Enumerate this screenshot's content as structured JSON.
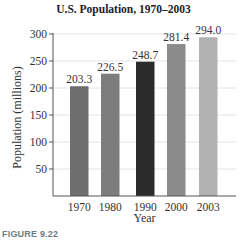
{
  "chart_data": {
    "type": "bar",
    "title": "U.S. Population, 1970–2003",
    "xlabel": "Year",
    "ylabel": "Population (millions)",
    "categories": [
      "1970",
      "1980",
      "1990",
      "2000",
      "2003"
    ],
    "values": [
      203.3,
      226.5,
      248.7,
      281.4,
      294.0
    ],
    "value_labels": [
      "203.3",
      "226.5",
      "248.7",
      "281.4",
      "294.0"
    ],
    "bar_colors": [
      "#6e6e6e",
      "#7d7d7d",
      "#2b2b2b",
      "#8b8b8b",
      "#b2b2b2"
    ],
    "ylim": [
      0,
      300
    ],
    "yticks": [
      50,
      100,
      150,
      200,
      250,
      300
    ],
    "grid": true,
    "legend": null
  },
  "figure_caption": "FIGURE 9.22"
}
